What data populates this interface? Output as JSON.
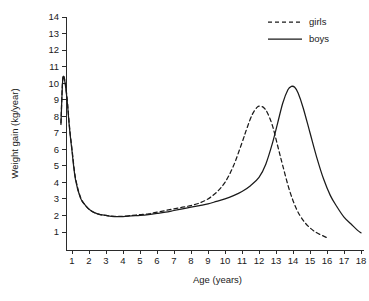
{
  "chart_data": {
    "type": "line",
    "title": "",
    "xlabel": "Age (years)",
    "ylabel": "Weight gain (kg/year)",
    "xlim": [
      0.3,
      18
    ],
    "ylim": [
      0,
      14
    ],
    "grid": false,
    "legend_position": "top-right",
    "xticks": [
      1,
      2,
      3,
      4,
      5,
      6,
      7,
      8,
      9,
      10,
      11,
      12,
      13,
      14,
      15,
      16,
      17,
      18
    ],
    "xtick_labels": [
      "1",
      "2",
      "3",
      "4",
      "5",
      "6",
      "7",
      "8",
      "9",
      "10",
      "11",
      "12",
      "13",
      "14",
      "15",
      "16",
      "17",
      "18"
    ],
    "yticks": [
      1,
      2,
      3,
      4,
      5,
      6,
      7,
      8,
      9,
      10,
      11,
      12,
      13,
      14
    ],
    "ytick_labels": [
      "1",
      "2",
      "3",
      "4",
      "5",
      "6",
      "7",
      "8",
      "9",
      "10",
      "11",
      "12",
      "13",
      "14"
    ],
    "series": [
      {
        "name": "girls",
        "style": "dashed",
        "color": "#1a1a1a",
        "x": [
          0.35,
          0.45,
          0.55,
          0.7,
          0.85,
          1.0,
          1.2,
          1.5,
          1.8,
          2.1,
          2.5,
          3.0,
          3.5,
          4.0,
          4.5,
          5.0,
          5.5,
          6.0,
          6.5,
          7.0,
          7.5,
          8.0,
          8.5,
          9.0,
          9.5,
          10.0,
          10.5,
          11.0,
          11.3,
          11.6,
          11.9,
          12.1,
          12.3,
          12.5,
          12.8,
          13.1,
          13.4,
          13.8,
          14.2,
          14.6,
          15.0,
          15.4,
          15.8,
          16.0
        ],
        "y": [
          7.6,
          10.2,
          10.3,
          9.2,
          7.4,
          6.0,
          4.3,
          3.1,
          2.6,
          2.3,
          2.1,
          2.0,
          1.95,
          1.95,
          2.0,
          2.05,
          2.1,
          2.2,
          2.3,
          2.4,
          2.5,
          2.6,
          2.75,
          3.0,
          3.4,
          4.0,
          5.0,
          6.4,
          7.3,
          8.1,
          8.55,
          8.6,
          8.5,
          8.2,
          7.4,
          6.2,
          5.0,
          3.5,
          2.4,
          1.7,
          1.25,
          0.95,
          0.75,
          0.65
        ]
      },
      {
        "name": "boys",
        "style": "solid",
        "color": "#1a1a1a",
        "x": [
          0.35,
          0.45,
          0.55,
          0.7,
          0.85,
          1.0,
          1.2,
          1.5,
          1.8,
          2.1,
          2.5,
          3.0,
          3.5,
          4.0,
          4.5,
          5.0,
          5.5,
          6.0,
          6.5,
          7.0,
          7.5,
          8.0,
          8.5,
          9.0,
          9.5,
          10.0,
          10.5,
          11.0,
          11.5,
          12.0,
          12.4,
          12.8,
          13.1,
          13.4,
          13.7,
          13.9,
          14.1,
          14.3,
          14.6,
          15.0,
          15.4,
          15.8,
          16.2,
          16.6,
          17.0,
          17.4,
          17.8,
          18.0
        ],
        "y": [
          7.5,
          10.1,
          10.25,
          9.1,
          7.3,
          5.9,
          4.2,
          3.05,
          2.6,
          2.3,
          2.1,
          2.0,
          1.93,
          1.93,
          1.97,
          2.0,
          2.05,
          2.12,
          2.2,
          2.3,
          2.4,
          2.5,
          2.6,
          2.7,
          2.85,
          3.0,
          3.2,
          3.45,
          3.8,
          4.3,
          5.1,
          6.4,
          7.6,
          8.8,
          9.6,
          9.8,
          9.75,
          9.4,
          8.5,
          7.0,
          5.5,
          4.2,
          3.2,
          2.5,
          1.9,
          1.5,
          1.1,
          0.95
        ]
      }
    ],
    "legend": [
      {
        "label": "girls",
        "style": "dashed"
      },
      {
        "label": "boys",
        "style": "solid"
      }
    ]
  }
}
